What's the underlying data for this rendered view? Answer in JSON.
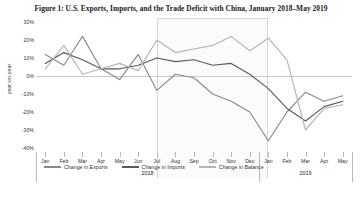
{
  "figure": {
    "title": "Figure 1: U.S. Exports, Imports, and the Trade Deficit with China, January 2018–May 2019"
  },
  "chart_data": {
    "type": "line",
    "title": "Figure 1: U.S. Exports, Imports, and the Trade Deficit with China, January 2018–May 2019",
    "xlabel": "",
    "ylabel": "year-on-year",
    "ylim": [
      -40,
      30
    ],
    "yticks": [
      30,
      20,
      10,
      0,
      -10,
      -20,
      -30,
      -40
    ],
    "ytick_labels": [
      "30%",
      "20%",
      "10%",
      "0%",
      "-10%",
      "-20%",
      "-30%",
      "-40%"
    ],
    "grid": false,
    "zero_line": 0,
    "legend_position": "bottom",
    "categories": [
      "Jan",
      "Feb",
      "Mar",
      "Apr",
      "May",
      "Jun",
      "Jul",
      "Aug",
      "Sep",
      "Oct",
      "Nov",
      "Dec",
      "Jan",
      "Feb",
      "Mar",
      "Apr",
      "May"
    ],
    "x": [
      "2018-01",
      "2018-02",
      "2018-03",
      "2018-04",
      "2018-05",
      "2018-06",
      "2018-07",
      "2018-08",
      "2018-09",
      "2018-10",
      "2018-11",
      "2018-12",
      "2019-01",
      "2019-02",
      "2019-03",
      "2019-04",
      "2019-05"
    ],
    "year_groups": [
      {
        "label": "2018",
        "start_index": 0,
        "end_index": 11
      },
      {
        "label": "2019",
        "start_index": 12,
        "end_index": 16
      }
    ],
    "shaded_region": {
      "start_index": 6,
      "end_index": 12,
      "color": "#fbfbfb"
    },
    "series": [
      {
        "name": "Change in Exports",
        "color": "#8a8a8a",
        "values": [
          12,
          6,
          22,
          4,
          -2,
          12,
          -8,
          1,
          -1,
          -10,
          -14,
          -20,
          -36,
          -20,
          -9,
          -14,
          -11
        ]
      },
      {
        "name": "Change in Imports",
        "color": "#5a5a5a",
        "values": [
          7,
          13,
          9,
          4,
          4,
          6,
          10,
          8,
          9,
          6,
          7,
          1,
          -7,
          -18,
          -25,
          -17,
          -14
        ]
      },
      {
        "name": "Change in Balance",
        "color": "#b5b5b5",
        "values": [
          4,
          17,
          1,
          4,
          7,
          3,
          20,
          13,
          15,
          17,
          22,
          14,
          21,
          9,
          -30,
          -18,
          -16
        ]
      }
    ]
  },
  "legend": {
    "items": [
      {
        "label": "Change in Exports",
        "color": "#8a8a8a"
      },
      {
        "label": "Change in Imports",
        "color": "#5a5a5a"
      },
      {
        "label": "Change in Balance",
        "color": "#b5b5b5"
      }
    ]
  }
}
